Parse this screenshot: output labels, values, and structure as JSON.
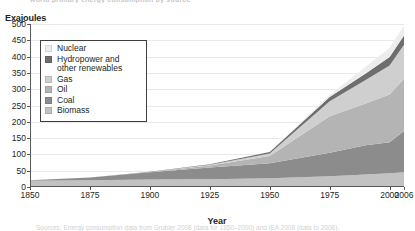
{
  "figure": {
    "top_cropped_text": "world primary energy consumption by source",
    "source_cropped_text": "Sources: Energy consumption data from Grubler 2008 (data for 1850–2000) and IEA 2008 (data to 2006)."
  },
  "axes": {
    "ylabel": "Exajoules",
    "xlabel": "Year",
    "y_ticks": [
      0,
      50,
      100,
      150,
      200,
      250,
      300,
      350,
      400,
      450,
      500
    ],
    "x_ticks": [
      1850,
      1875,
      1900,
      1925,
      1950,
      1975,
      2000,
      2006
    ],
    "x_tick_labels": [
      "1850",
      "1875",
      "1900",
      "1925",
      "1950",
      "1975",
      "2000",
      "2006"
    ],
    "ylim": [
      0,
      500
    ],
    "xlim": [
      1850,
      2006
    ],
    "grid": true
  },
  "legend": {
    "position": "upper-left-inset",
    "items": [
      {
        "label": "Nuclear",
        "color": "#ededed"
      },
      {
        "label": "Hydropower and\nother renewables",
        "color": "#6e6e6e"
      },
      {
        "label": "Gas",
        "color": "#cfcfcf"
      },
      {
        "label": "Oil",
        "color": "#b4b4b4"
      },
      {
        "label": "Coal",
        "color": "#8c8c8c"
      },
      {
        "label": "Biomass",
        "color": "#c2c2c2"
      }
    ]
  },
  "chart_data": {
    "type": "area",
    "title": "World primary energy consumption by source",
    "xlabel": "Year",
    "ylabel": "Exajoules",
    "ylim": [
      0,
      500
    ],
    "xlim": [
      1850,
      2006
    ],
    "grid": true,
    "stacking": "bottom-to-top: Biomass, Coal, Oil, Gas, Hydropower and other renewables, Nuclear",
    "x": [
      1850,
      1875,
      1900,
      1925,
      1950,
      1975,
      1990,
      2000,
      2006
    ],
    "series": [
      {
        "name": "Biomass",
        "color": "#c2c2c2",
        "values": [
          19,
          21,
          23,
          24,
          27,
          33,
          38,
          42,
          45
        ]
      },
      {
        "name": "Coal",
        "color": "#8c8c8c",
        "values": [
          2,
          8,
          22,
          36,
          46,
          72,
          90,
          95,
          127
        ]
      },
      {
        "name": "Oil",
        "color": "#b4b4b4",
        "values": [
          0,
          0,
          1,
          6,
          22,
          112,
          128,
          147,
          160
        ]
      },
      {
        "name": "Gas",
        "color": "#cfcfcf",
        "values": [
          0,
          0,
          0,
          2,
          8,
          46,
          72,
          89,
          104
        ]
      },
      {
        "name": "Hydropower and other renewables",
        "color": "#6e6e6e",
        "values": [
          0,
          0,
          1,
          2,
          4,
          13,
          20,
          26,
          29
        ]
      },
      {
        "name": "Nuclear",
        "color": "#ededed",
        "values": [
          0,
          0,
          0,
          0,
          0,
          6,
          21,
          27,
          30
        ]
      }
    ],
    "totals": [
      21,
      29,
      47,
      70,
      107,
      282,
      369,
      426,
      495
    ]
  }
}
